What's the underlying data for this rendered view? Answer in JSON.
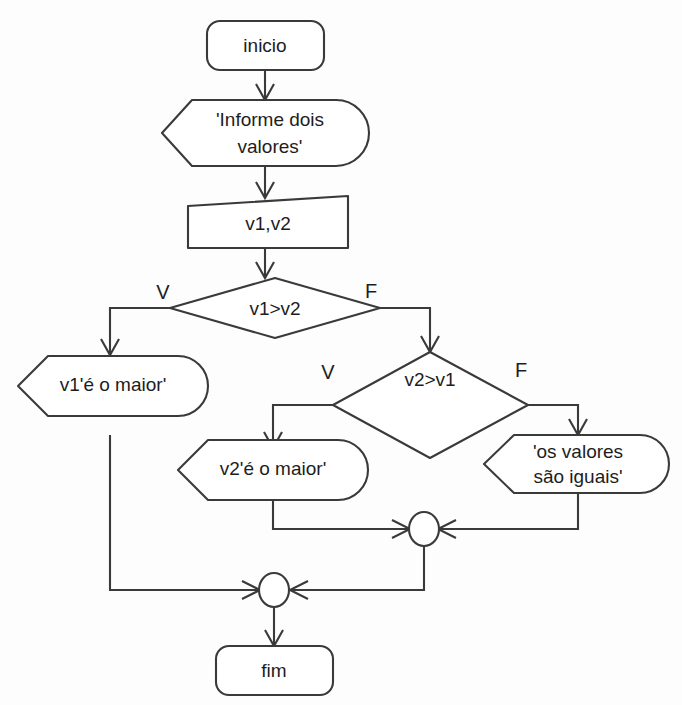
{
  "diagram": {
    "colors": {
      "stroke": "#3a3a3a",
      "fill": "#ffffff",
      "text": "#1d1d1d",
      "background": "#fdfdfd"
    },
    "nodes": {
      "start": {
        "label": "inicio",
        "type": "terminator"
      },
      "prompt": {
        "label_line1": "'Informe dois",
        "label_line2": "valores'",
        "type": "output"
      },
      "input": {
        "label": "v1,v2",
        "type": "input-parallelogram"
      },
      "decision1": {
        "label": "v1>v2",
        "type": "decision"
      },
      "decision2": {
        "label": "v2>v1",
        "type": "decision"
      },
      "out_v1": {
        "label": "v1'é o maior'",
        "type": "output"
      },
      "out_v2": {
        "label": "v2'é o maior'",
        "type": "output"
      },
      "out_equal": {
        "label_line1": "'os valores",
        "label_line2": "são iguais'",
        "type": "output"
      },
      "merge_inner": {
        "label": "",
        "type": "merge-connector"
      },
      "merge_outer": {
        "label": "",
        "type": "merge-connector"
      },
      "end": {
        "label": "fim",
        "type": "terminator"
      }
    },
    "branch_labels": {
      "d1_true": "V",
      "d1_false": "F",
      "d2_true": "V",
      "d2_false": "F"
    }
  }
}
